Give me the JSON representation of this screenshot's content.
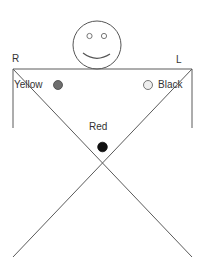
{
  "diagram": {
    "corner_labels": {
      "right_side": "R",
      "left_side": "L"
    },
    "markers": [
      {
        "label": "Yellow",
        "fill": "#6e6e6e",
        "stroke": "#444444"
      },
      {
        "label": "Black",
        "fill": "#eeeeee",
        "stroke": "#555555"
      },
      {
        "label": "Red",
        "fill": "#111111",
        "stroke": "#111111"
      }
    ],
    "colors": {
      "line": "#5a5a5a",
      "face": "#555555"
    }
  }
}
